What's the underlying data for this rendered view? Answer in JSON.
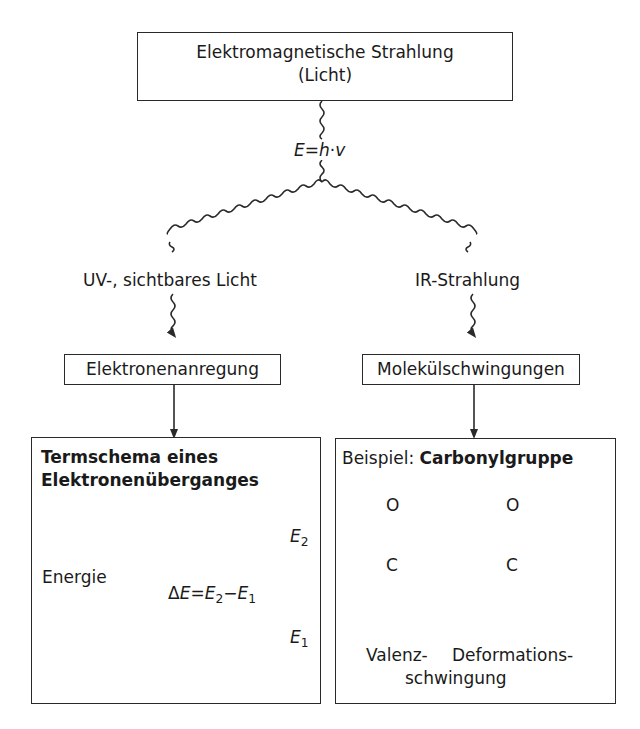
{
  "top_box": {
    "line1": "Elektromagnetische Strahlung",
    "line2": "(Licht)"
  },
  "equation": {
    "E": "E",
    "equals": "=",
    "h": "h",
    "dot": "·",
    "v": "v"
  },
  "branches": {
    "left": {
      "label": "UV-, sichtbares Licht",
      "box_label": "Elektronenanregung"
    },
    "right": {
      "label": "IR-Strahlung",
      "box_label": "Molekülschwingungen"
    }
  },
  "term_scheme": {
    "title_line1": "Termschema eines",
    "title_line2": "Elektronenüberganges",
    "energy_label": "Energie",
    "level_upper": {
      "symbol": "E",
      "sub": "2"
    },
    "level_lower": {
      "symbol": "E",
      "sub": "1"
    },
    "delta": {
      "prefix": "Δ",
      "E": "E",
      "eq": "=",
      "E2": "E",
      "E2_sub": "2",
      "minus": "−",
      "E1": "E",
      "E1_sub": "1"
    }
  },
  "carbonyl": {
    "title_prefix": "Beispiel: ",
    "title_bold": "Carbonylgruppe",
    "atom_top": "O",
    "atom_bottom": "C",
    "label_valence": "Valenz-",
    "label_deformation": "Deformations-",
    "label_common": "schwingung"
  },
  "colors": {
    "line": "#2a2a2a",
    "background": "#ffffff"
  }
}
